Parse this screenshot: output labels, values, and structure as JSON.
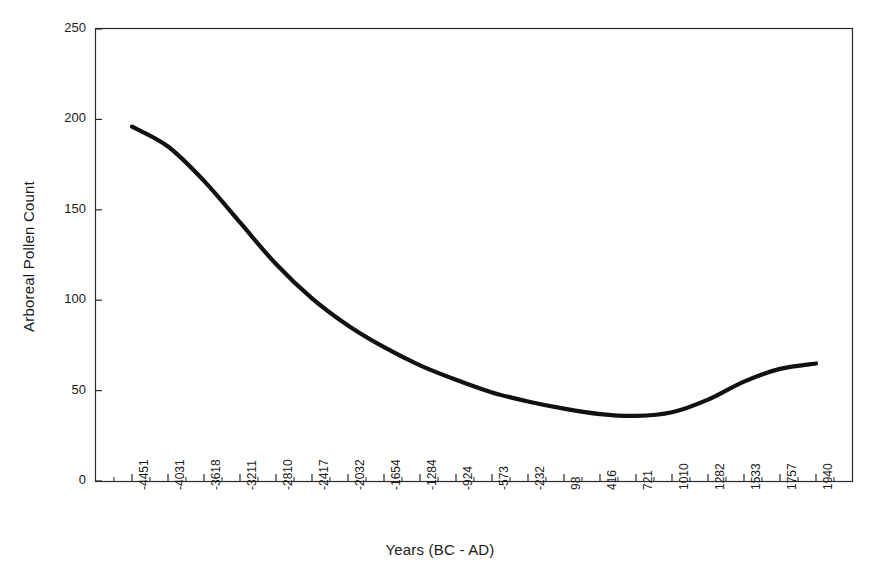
{
  "chart_data": {
    "type": "line",
    "title": "",
    "xlabel": "Years (BC - AD)",
    "ylabel": "Arboreal Pollen Count",
    "ylim": [
      0,
      250
    ],
    "ytick_values": [
      0,
      50,
      100,
      150,
      200,
      250
    ],
    "grid": false,
    "legend": "none",
    "line_color": "#111111",
    "line_width": 4,
    "categories": [
      "-4451",
      "-4031",
      "-3618",
      "-3211",
      "-2810",
      "-2417",
      "-2032",
      "-1654",
      "-1284",
      "-924",
      "-573",
      "-232",
      "98",
      "416",
      "721",
      "1010",
      "1282",
      "1533",
      "1757",
      "1940"
    ],
    "x": [
      -4451,
      -4031,
      -3618,
      -3211,
      -2810,
      -2417,
      -2032,
      -1654,
      -1284,
      -924,
      -573,
      -232,
      98,
      416,
      721,
      1010,
      1282,
      1533,
      1757,
      1940
    ],
    "values": [
      196,
      185,
      166,
      143,
      120,
      101,
      86,
      74,
      64,
      56,
      49,
      44,
      40,
      37,
      36,
      38,
      45,
      55,
      62,
      65
    ],
    "series": [
      {
        "name": "Arboreal Pollen Count",
        "values": [
          196,
          185,
          166,
          143,
          120,
          101,
          86,
          74,
          64,
          56,
          49,
          44,
          40,
          37,
          36,
          38,
          45,
          55,
          62,
          65
        ]
      }
    ],
    "annotations": {
      "start_value": 196,
      "minimum_value": 36,
      "minimum_at": "721",
      "end_value": 65
    }
  },
  "axes": {
    "y_title": "Arboreal Pollen Count",
    "x_title": "Years (BC - AD)",
    "y_ticks": [
      {
        "label": "250",
        "value": 250
      },
      {
        "label": "200",
        "value": 200
      },
      {
        "label": "150",
        "value": 150
      },
      {
        "label": "100",
        "value": 100
      },
      {
        "label": "50",
        "value": 50
      },
      {
        "label": "0",
        "value": 0
      }
    ],
    "x_ticks": [
      {
        "label": "-4451"
      },
      {
        "label": "-4031"
      },
      {
        "label": "-3618"
      },
      {
        "label": "-3211"
      },
      {
        "label": "-2810"
      },
      {
        "label": "-2417"
      },
      {
        "label": "-2032"
      },
      {
        "label": "-1654"
      },
      {
        "label": "-1284"
      },
      {
        "label": "-924"
      },
      {
        "label": "-573"
      },
      {
        "label": "-232"
      },
      {
        "label": "98"
      },
      {
        "label": "416"
      },
      {
        "label": "721"
      },
      {
        "label": "1010"
      },
      {
        "label": "1282"
      },
      {
        "label": "1533"
      },
      {
        "label": "1757"
      },
      {
        "label": "1940"
      }
    ]
  }
}
